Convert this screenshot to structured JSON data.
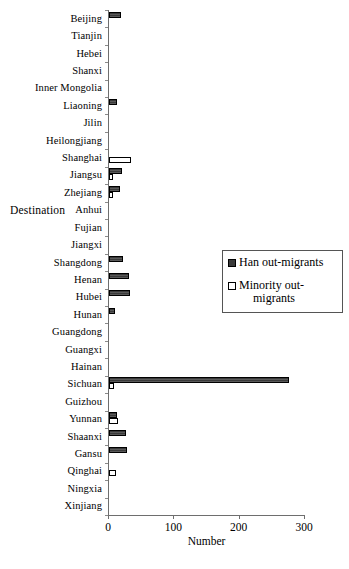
{
  "chart_data": {
    "type": "bar",
    "orientation": "horizontal",
    "title": "",
    "xlabel": "Number",
    "ylabel": "Destination",
    "xlim": [
      0,
      300
    ],
    "xticks": [
      0,
      100,
      200,
      300
    ],
    "xtick_labels": [
      "0",
      "100",
      "200",
      "300"
    ],
    "grid": false,
    "legend_position": "center-right",
    "categories": [
      "Beijing",
      "Tianjin",
      "Hebei",
      "Shanxi",
      "Inner Mongolia",
      "Liaoning",
      "Jilin",
      "Heilongjiang",
      "Shanghai",
      "Jiangsu",
      "Zhejiang",
      "Anhui",
      "Fujian",
      "Jiangxi",
      "Shangdong",
      "Henan",
      "Hubei",
      "Hunan",
      "Guangdong",
      "Guangxi",
      "Hainan",
      "Sichuan",
      "Guizhou",
      "Yunnan",
      "Shaanxi",
      "Gansu",
      "Qinghai",
      "Ningxia",
      "Xinjiang"
    ],
    "series": [
      {
        "name": "Han out-migrants",
        "color": "#3a3a3a",
        "values": [
          18,
          0,
          0,
          0,
          0,
          12,
          0,
          0,
          0,
          20,
          17,
          0,
          0,
          0,
          21,
          31,
          32,
          9,
          0,
          0,
          0,
          276,
          0,
          12,
          26,
          28,
          0,
          0,
          0
        ]
      },
      {
        "name": "Minority out-migrants",
        "color": "#ffffff",
        "values": [
          0,
          0,
          0,
          0,
          0,
          0,
          0,
          0,
          34,
          6,
          6,
          0,
          0,
          0,
          0,
          0,
          0,
          0,
          0,
          0,
          0,
          7,
          0,
          14,
          0,
          0,
          11,
          0,
          0
        ]
      }
    ]
  },
  "legend": {
    "items": [
      {
        "label": "Han out-migrants",
        "line1": "Han out-migrants",
        "line2": ""
      },
      {
        "label": "Minority out-migrants",
        "line1": "Minority out-",
        "line2": "migrants"
      }
    ]
  },
  "axes": {
    "x_title": "Number",
    "y_title": "Destination"
  }
}
